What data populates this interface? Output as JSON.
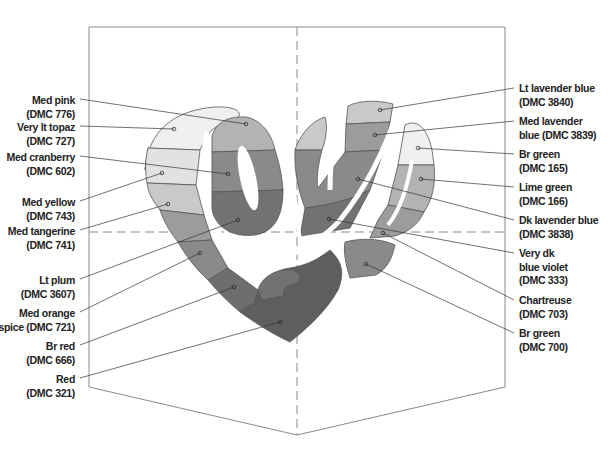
{
  "diagram": {
    "card": {
      "left": 89,
      "right": 505,
      "top": 27,
      "bottom_side": 387,
      "bottom_point": 435,
      "fold_x": 297,
      "fold_y": 232,
      "stroke_color": "#8a8a8a"
    },
    "left_labels": [
      {
        "name": "Med pink",
        "code": "(DMC 776)",
        "x_right": 75,
        "y": 94,
        "tip": [
          246,
          124
        ],
        "start": [
          80,
          99
        ]
      },
      {
        "name": "Very lt topaz",
        "code": "(DMC 727)",
        "x_right": 75,
        "y": 121,
        "tip": [
          174,
          129
        ],
        "start": [
          80,
          126
        ]
      },
      {
        "name": "Med cranberry",
        "code": "(DMC 602)",
        "x_right": 75,
        "y": 151,
        "tip": [
          228,
          174
        ],
        "start": [
          80,
          156
        ]
      },
      {
        "name": "Med yellow",
        "code": "(DMC 743)",
        "x_right": 75,
        "y": 196,
        "tip": [
          162,
          173
        ],
        "start": [
          80,
          201
        ]
      },
      {
        "name": "Med tangerine",
        "code": "(DMC 741)",
        "x_right": 75,
        "y": 225,
        "tip": [
          168,
          204
        ],
        "start": [
          80,
          230
        ]
      },
      {
        "name": "Lt plum",
        "code": "(DMC 3607)",
        "x_right": 75,
        "y": 274,
        "tip": [
          238,
          220
        ],
        "start": [
          80,
          279
        ]
      },
      {
        "name": "Med orange",
        "code": "spice (DMC 721)",
        "x_right": 75,
        "y": 307,
        "tip": [
          200,
          253
        ],
        "start": [
          80,
          312
        ]
      },
      {
        "name": "Br red",
        "code": "(DMC 666)",
        "x_right": 75,
        "y": 340,
        "tip": [
          234,
          287
        ],
        "start": [
          80,
          345
        ]
      },
      {
        "name": "Red",
        "code": "(DMC 321)",
        "x_right": 75,
        "y": 373,
        "tip": [
          280,
          322
        ],
        "start": [
          80,
          378
        ]
      }
    ],
    "right_labels": [
      {
        "name": "Lt lavender blue",
        "code": "(DMC 3840)",
        "x_left": 519,
        "y": 82,
        "tip": [
          380,
          110
        ],
        "start": [
          514,
          88
        ]
      },
      {
        "name": "Med lavender",
        "code": "blue (DMC 3839)",
        "x_left": 519,
        "y": 115,
        "tip": [
          375,
          135
        ],
        "start": [
          514,
          121
        ]
      },
      {
        "name": "Br green",
        "code": "(DMC 165)",
        "x_left": 519,
        "y": 148,
        "tip": [
          418,
          148
        ],
        "start": [
          514,
          154
        ]
      },
      {
        "name": "Lime green",
        "code": "(DMC 166)",
        "x_left": 519,
        "y": 181,
        "tip": [
          421,
          179
        ],
        "start": [
          514,
          187
        ]
      },
      {
        "name": "Dk lavender blue",
        "code": "(DMC 3838)",
        "x_left": 519,
        "y": 214,
        "tip": [
          358,
          179
        ],
        "start": [
          514,
          220
        ]
      },
      {
        "name": "Very dk",
        "code": "blue violet",
        "code2": "(DMC 333)",
        "x_left": 519,
        "y": 247,
        "tip": [
          329,
          219
        ],
        "start": [
          514,
          253
        ]
      },
      {
        "name": "Chartreuse",
        "code": "(DMC 703)",
        "x_left": 519,
        "y": 294,
        "tip": [
          383,
          233
        ],
        "start": [
          514,
          300
        ]
      },
      {
        "name": "Br green",
        "code": "(DMC 700)",
        "x_left": 519,
        "y": 327,
        "tip": [
          366,
          264
        ],
        "start": [
          514,
          333
        ]
      }
    ],
    "fills": {
      "lightest": "#efefef",
      "very_light": "#e2e2e2",
      "light": "#c9c9c9",
      "mid_light": "#b3b3b3",
      "mid": "#9c9c9c",
      "mid_dark": "#8a8a8a",
      "dark": "#727272",
      "darker": "#5e5e5e",
      "darkest": "#4d4d4d",
      "outline": "#555555"
    }
  }
}
